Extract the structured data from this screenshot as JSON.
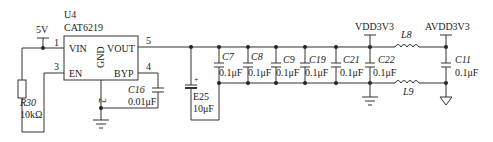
{
  "schematic": {
    "regulator": {
      "ref": "U4",
      "part": "CAT6219",
      "pins": {
        "vin": {
          "name": "VIN",
          "number": "1"
        },
        "en": {
          "name": "EN",
          "number": "3"
        },
        "gnd": {
          "name": "GND",
          "number": "2"
        },
        "vout": {
          "name": "VOUT",
          "number": "5"
        },
        "byp": {
          "name": "BYP",
          "number": "4"
        }
      }
    },
    "supply_in": "5V",
    "resistor": {
      "ref": "R30",
      "value": "10kΩ"
    },
    "bypass_cap": {
      "ref": "C16",
      "value": "0.01μF"
    },
    "bulk_cap": {
      "ref": "E25",
      "value": "10μF"
    },
    "decoupling_caps": [
      {
        "ref": "C7",
        "value": "0.1μF"
      },
      {
        "ref": "C8",
        "value": "0.1μF"
      },
      {
        "ref": "C9",
        "value": "0.1μF"
      },
      {
        "ref": "C19",
        "value": "0.1μF"
      },
      {
        "ref": "C21",
        "value": "0.1μF"
      },
      {
        "ref": "C22",
        "value": "0.1μF"
      }
    ],
    "rails": {
      "digital": "VDD3V3",
      "analog": "AVDD3V3"
    },
    "inductors": [
      {
        "ref": "L8"
      },
      {
        "ref": "L9"
      }
    ],
    "analog_cap": {
      "ref": "C11",
      "value": "0.1μF"
    }
  }
}
